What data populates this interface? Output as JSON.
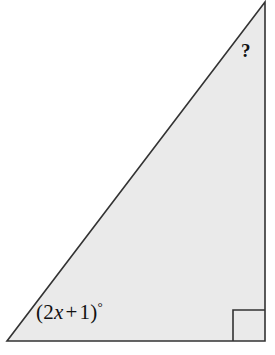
{
  "figure": {
    "name": "right-triangle-diagram",
    "type": "geometry-diagram",
    "shape": "right triangle",
    "background_color": "#ffffff",
    "fill_color": "#eaeaea",
    "stroke_color": "#333333",
    "vertices": {
      "bottom_left": [
        7,
        341
      ],
      "bottom_right": [
        265,
        341
      ],
      "apex_top_right": [
        265,
        2
      ]
    },
    "labels": {
      "angle_expression_open_paren": "(",
      "angle_expression_coefficient": "2",
      "angle_expression_variable": "x",
      "angle_expression_operator": "+",
      "angle_expression_constant": "1",
      "angle_expression_close_paren": ")",
      "angle_expression_degree": "°",
      "angle_expression_full": "(2x + 1)°",
      "unknown_angle": "?"
    },
    "right_angle_marker": {
      "name": "right-angle-square",
      "present": true,
      "corner": "bottom-right",
      "size": 31
    }
  }
}
